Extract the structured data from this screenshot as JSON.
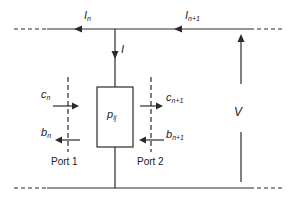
{
  "diagram": {
    "type": "two-port circuit node model",
    "labels": {
      "current_n": {
        "base": "I",
        "sub": "n"
      },
      "current_n1": {
        "base": "I",
        "sub": "n+1"
      },
      "branch_current": {
        "base": "I",
        "sub": ""
      },
      "voltage": {
        "base": "V",
        "sub": ""
      },
      "element": {
        "base": "p",
        "sub": "ij"
      },
      "incident_1": {
        "base": "c",
        "sub": "n"
      },
      "reflected_1": {
        "base": "b",
        "sub": "n"
      },
      "incident_2": {
        "base": "c",
        "sub": "n+1"
      },
      "reflected_2": {
        "base": "b",
        "sub": "n+1"
      }
    },
    "ports": {
      "port1": "Port 1",
      "port2": "Port 2"
    },
    "colors": {
      "line": "#2a2a2a",
      "background": "#ffffff"
    }
  }
}
